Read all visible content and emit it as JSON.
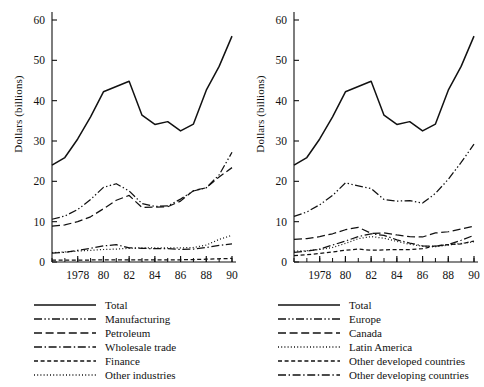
{
  "figure": {
    "background": "#ffffff",
    "ink": "#111111"
  },
  "axis": {
    "ylabel": "Dollars (billions)",
    "yticks": [
      "0",
      "10",
      "20",
      "30",
      "40",
      "50",
      "60"
    ],
    "xticks": [
      "1978",
      "80",
      "82",
      "84",
      "86",
      "88",
      "90"
    ]
  },
  "chart_data": [
    {
      "type": "line",
      "title": "",
      "xlabel": "",
      "ylabel": "Dollars (billions)",
      "xlim": [
        1976,
        1990
      ],
      "ylim": [
        0,
        60
      ],
      "grid": false,
      "legend_position": "below",
      "x": [
        1976,
        1977,
        1978,
        1979,
        1980,
        1981,
        1982,
        1983,
        1984,
        1985,
        1986,
        1987,
        1988,
        1989,
        1990
      ],
      "xtick_values": [
        1978,
        1980,
        1982,
        1984,
        1986,
        1988,
        1990
      ],
      "ytick_values": [
        0,
        10,
        20,
        30,
        40,
        50,
        60
      ],
      "series": [
        {
          "name": "Total",
          "style": "solid",
          "values": [
            24.0,
            25.9,
            30.5,
            36.0,
            42.2,
            43.5,
            44.8,
            36.4,
            34.1,
            34.8,
            32.5,
            34.2,
            42.6,
            48.5,
            56.0
          ]
        },
        {
          "name": "Manufacturing",
          "style": "dash-dot-dot",
          "values": [
            10.6,
            11.4,
            13.0,
            15.5,
            18.5,
            19.4,
            17.6,
            14.5,
            13.8,
            13.9,
            15.6,
            17.6,
            18.4,
            21.6,
            27.2
          ]
        },
        {
          "name": "Petroleum",
          "style": "long-dash",
          "values": [
            8.9,
            9.2,
            10.0,
            11.2,
            13.2,
            15.3,
            16.5,
            13.5,
            13.6,
            13.7,
            15.1,
            17.7,
            18.4,
            21.1,
            23.4
          ]
        },
        {
          "name": "Wholesale trade",
          "style": "dash-dot",
          "values": [
            2.2,
            2.4,
            2.9,
            3.4,
            4.0,
            4.3,
            3.5,
            3.4,
            3.3,
            3.3,
            3.1,
            3.2,
            3.6,
            4.1,
            4.5
          ]
        },
        {
          "name": "Finance",
          "style": "short-dash",
          "values": [
            0.45,
            0.45,
            0.45,
            0.5,
            0.5,
            0.5,
            0.5,
            0.5,
            0.5,
            0.5,
            0.55,
            0.6,
            0.7,
            0.8,
            0.9
          ]
        },
        {
          "name": "Other industries",
          "style": "dotted",
          "values": [
            2.3,
            2.5,
            2.7,
            2.9,
            3.1,
            3.2,
            3.4,
            3.5,
            3.5,
            3.5,
            3.5,
            3.6,
            4.2,
            5.6,
            6.6
          ]
        }
      ]
    },
    {
      "type": "line",
      "title": "",
      "xlabel": "",
      "ylabel": "Dollars (billions)",
      "xlim": [
        1976,
        1990
      ],
      "ylim": [
        0,
        60
      ],
      "grid": false,
      "legend_position": "below",
      "x": [
        1976,
        1977,
        1978,
        1979,
        1980,
        1981,
        1982,
        1983,
        1984,
        1985,
        1986,
        1987,
        1988,
        1989,
        1990
      ],
      "xtick_values": [
        1978,
        1980,
        1982,
        1984,
        1986,
        1988,
        1990
      ],
      "ytick_values": [
        0,
        10,
        20,
        30,
        40,
        50,
        60
      ],
      "series": [
        {
          "name": "Total",
          "style": "solid",
          "values": [
            24.0,
            25.9,
            30.5,
            36.0,
            42.2,
            43.5,
            44.8,
            36.4,
            34.1,
            34.8,
            32.5,
            34.2,
            42.6,
            48.5,
            56.0
          ]
        },
        {
          "name": "Europe",
          "style": "dash-dot-dot",
          "values": [
            11.3,
            12.4,
            14.2,
            16.5,
            19.6,
            18.9,
            18.2,
            15.5,
            15.1,
            15.2,
            14.6,
            17.0,
            20.5,
            24.7,
            29.2
          ]
        },
        {
          "name": "Canada",
          "style": "long-dash",
          "values": [
            5.6,
            5.8,
            6.3,
            7.0,
            8.0,
            8.6,
            7.1,
            7.2,
            6.7,
            6.3,
            6.2,
            7.2,
            7.5,
            8.2,
            8.9
          ]
        },
        {
          "name": "Latin America",
          "style": "dotted",
          "values": [
            2.7,
            2.8,
            3.1,
            3.6,
            4.6,
            5.8,
            6.3,
            5.9,
            5.1,
            4.4,
            3.9,
            3.8,
            4.2,
            4.6,
            5.0
          ]
        },
        {
          "name": "Other developed countries",
          "style": "short-dash",
          "values": [
            1.6,
            1.8,
            2.1,
            2.5,
            2.9,
            3.2,
            2.9,
            3.0,
            3.1,
            3.1,
            3.3,
            4.0,
            4.3,
            4.5,
            5.2
          ]
        },
        {
          "name": "Other developing countries",
          "style": "dash-dot",
          "values": [
            2.4,
            2.7,
            3.2,
            4.2,
            5.2,
            6.3,
            7.0,
            6.6,
            5.5,
            4.7,
            4.0,
            3.9,
            4.3,
            5.4,
            6.6
          ]
        }
      ]
    }
  ],
  "panels": [
    {
      "id": "left",
      "ylabel": "Dollars (billions)",
      "legend": [
        {
          "label": "Total",
          "style": "solid"
        },
        {
          "label": "Manufacturing",
          "style": "dash-dot-dot"
        },
        {
          "label": "Petroleum",
          "style": "long-dash"
        },
        {
          "label": "Wholesale trade",
          "style": "dash-dot"
        },
        {
          "label": "Finance",
          "style": "short-dash"
        },
        {
          "label": "Other industries",
          "style": "dotted"
        }
      ]
    },
    {
      "id": "right",
      "ylabel": "Dollars (billions)",
      "legend": [
        {
          "label": "Total",
          "style": "solid"
        },
        {
          "label": "Europe",
          "style": "dash-dot-dot"
        },
        {
          "label": "Canada",
          "style": "long-dash"
        },
        {
          "label": "Latin America",
          "style": "dotted"
        },
        {
          "label": "Other developed countries",
          "style": "short-dash"
        },
        {
          "label": "Other developing countries",
          "style": "dash-dot"
        }
      ]
    }
  ]
}
